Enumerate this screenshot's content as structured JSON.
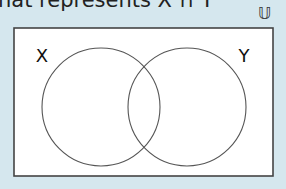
{
  "question": {
    "text": "hat represents X ∩ Y"
  },
  "diagram": {
    "universal_symbol": "𝕌",
    "set_labels": {
      "left": "X",
      "right": "Y"
    },
    "colors": {
      "background": "#d5e7ee",
      "box_fill": "#ffffff",
      "stroke": "#555555"
    }
  }
}
